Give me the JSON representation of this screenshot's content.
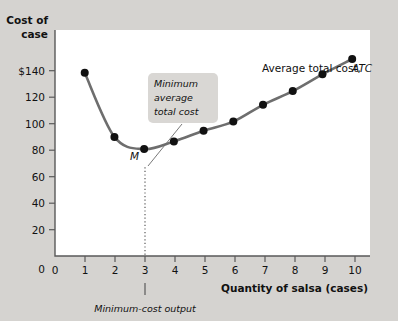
{
  "figure": {
    "y_axis_title_line1": "Cost of",
    "y_axis_title_line2": "case",
    "x_axis_title": "Quantity of salsa (cases)",
    "curve_label_main": "Average total cost,",
    "curve_label_symbol": "ATC",
    "point_label": "M",
    "callout": {
      "line1": "Minimum",
      "line2": "average",
      "line3": "total cost"
    },
    "footnote": "Minimum-cost output",
    "colors": {
      "page_background": "#d5d3d0",
      "plot_background": "#ffffff",
      "curve": "#6e6e6e",
      "marker": "#111111",
      "axis": "#5a5a5a",
      "callout_background": "#d9d7d4"
    }
  },
  "chart_data": {
    "type": "line",
    "title": "",
    "xlabel": "Quantity of salsa (cases)",
    "ylabel": "Cost of case",
    "xlim": [
      0,
      10.6
    ],
    "ylim": [
      0,
      148
    ],
    "grid": false,
    "legend": "none",
    "x": [
      1,
      2,
      3,
      4,
      5,
      6,
      7,
      8,
      9,
      10
    ],
    "xtick_labels": [
      "0",
      "1",
      "2",
      "3",
      "4",
      "5",
      "6",
      "7",
      "8",
      "9",
      "10"
    ],
    "xticks": [
      0,
      1,
      2,
      3,
      4,
      5,
      6,
      7,
      8,
      9,
      10
    ],
    "ytick_labels": [
      "0",
      "20",
      "40",
      "60",
      "80",
      "100",
      "120",
      "$140"
    ],
    "yticks": [
      0,
      20,
      40,
      60,
      80,
      100,
      120,
      140
    ],
    "series": [
      {
        "name": "Average total cost, ATC",
        "values": [
          120,
          78,
          70,
          75,
          82,
          88,
          99,
          108,
          119,
          129
        ]
      }
    ],
    "annotations": [
      {
        "name": "minimum-point",
        "label": "M",
        "x": 3,
        "y": 70
      },
      {
        "name": "callout",
        "label": "Minimum average total cost",
        "x": 3,
        "y": 70
      },
      {
        "name": "minimum-cost-output",
        "label": "Minimum-cost output",
        "x": 3
      }
    ]
  }
}
